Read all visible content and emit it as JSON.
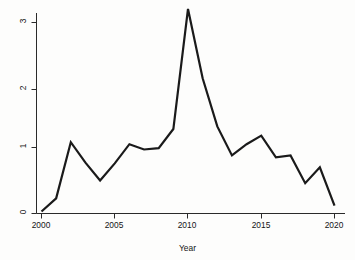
{
  "chart_data": {
    "type": "line",
    "title": "",
    "subtitle": "",
    "xlabel": "Year",
    "ylabel": "Total US Aid, US$ billions",
    "xlim": [
      2000,
      2020
    ],
    "ylim": [
      0,
      3.2
    ],
    "xticks": [
      2000,
      2005,
      2010,
      2015,
      2020
    ],
    "xtick_labels": [
      "2000",
      "2005",
      "2010",
      "2015",
      "2020"
    ],
    "yticks": [
      0,
      1,
      2,
      3
    ],
    "ytick_labels": [
      "0",
      "1",
      "2",
      "3"
    ],
    "grid": false,
    "legend": null,
    "legend_position": "none",
    "line_color": "#1a1a1a",
    "line_width": 2.2,
    "x": [
      2000,
      2001,
      2002,
      2003,
      2004,
      2005,
      2006,
      2007,
      2008,
      2009,
      2010,
      2011,
      2012,
      2013,
      2014,
      2015,
      2016,
      2017,
      2018,
      2019,
      2020
    ],
    "values": [
      0.03,
      0.23,
      1.08,
      0.77,
      0.5,
      0.76,
      1.05,
      0.97,
      0.99,
      1.28,
      3.1,
      2.05,
      1.32,
      0.88,
      1.05,
      1.18,
      0.85,
      0.88,
      0.46,
      0.7,
      0.12
    ],
    "series": [
      {
        "name": "Total US Aid",
        "values": [
          0.03,
          0.23,
          1.08,
          0.77,
          0.5,
          0.76,
          1.05,
          0.97,
          0.99,
          1.28,
          3.1,
          2.05,
          1.32,
          0.88,
          1.05,
          1.18,
          0.85,
          0.88,
          0.46,
          0.7,
          0.12
        ]
      }
    ],
    "annotations": []
  },
  "axes": {
    "y_title": "Total US Aid, US$ billions",
    "x_title": "Year",
    "y_labels": [
      "3",
      "2",
      "1",
      "0"
    ],
    "x_labels": [
      "2000",
      "2005",
      "2010",
      "2015",
      "2020"
    ]
  }
}
